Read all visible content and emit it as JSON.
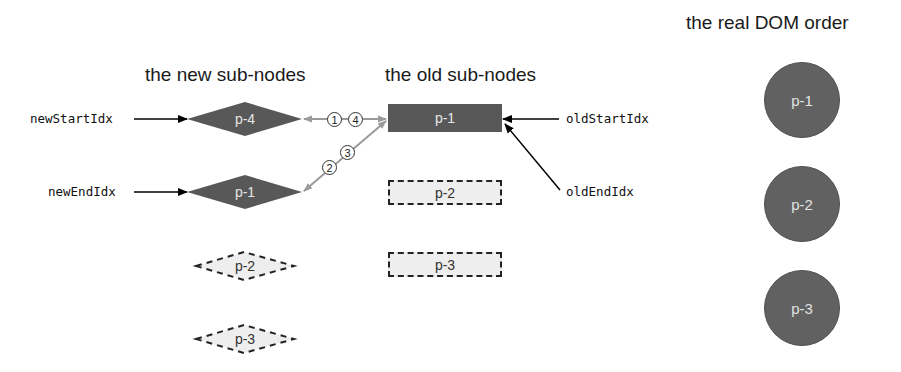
{
  "headings": {
    "new_nodes": "the new sub-nodes",
    "old_nodes": "the old sub-nodes",
    "dom_order": "the real DOM order"
  },
  "pointers": {
    "new_start": "newStartIdx",
    "new_end": "newEndIdx",
    "old_start": "oldStartIdx",
    "old_end": "oldEndIdx"
  },
  "new_nodes": [
    {
      "label": "p-4",
      "style": "solid"
    },
    {
      "label": "p-1",
      "style": "solid"
    },
    {
      "label": "p-2",
      "style": "dashed"
    },
    {
      "label": "p-3",
      "style": "dashed"
    }
  ],
  "old_nodes": [
    {
      "label": "p-1",
      "style": "solid"
    },
    {
      "label": "p-2",
      "style": "dashed"
    },
    {
      "label": "p-3",
      "style": "dashed"
    }
  ],
  "dom_nodes": [
    {
      "label": "p-1"
    },
    {
      "label": "p-2"
    },
    {
      "label": "p-3"
    }
  ],
  "comparison_steps": [
    "1",
    "4",
    "2",
    "3"
  ],
  "colors": {
    "solid_node": "#585858",
    "dashed_node_fill": "#eeeeee",
    "comparison_arrow": "#9a9a9a",
    "pointer_arrow": "#000000"
  }
}
